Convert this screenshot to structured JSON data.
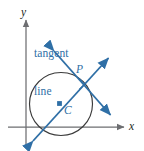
{
  "figure": {
    "kind": "geometry-diagram",
    "background_color": "#ffffff",
    "accent_color": "#2f6fa6",
    "axis_color": "#6d6e71",
    "circle_color": "#3b3b3b",
    "labels": {
      "tangent_line": "tangent\nline",
      "tangent_line_row1": "tangent",
      "tangent_line_row2": "line",
      "axis_x": "x",
      "axis_y": "y",
      "point_p": "P",
      "center_c": "C"
    },
    "geometry": {
      "axes": {
        "x_axis": {
          "x1": 8,
          "y1": 127,
          "x2": 127,
          "y2": 127,
          "arrow": "end"
        },
        "y_axis": {
          "x1": 26,
          "y1": 146,
          "x2": 26,
          "y2": 17,
          "arrow": "end"
        }
      },
      "circle": {
        "cx": 61,
        "cy": 104,
        "r": 31.5
      },
      "center_point": {
        "x": 59.5,
        "y": 103.5,
        "marker": "square"
      },
      "tangent_point": {
        "x": 79.5,
        "y": 80.5,
        "marker": "none"
      },
      "radius_line": {
        "x1": 31,
        "y1": 144,
        "x2": 111,
        "y2": 55,
        "arrows": "both",
        "description": "line through center C and point P extended both ways"
      },
      "tangent_line": {
        "x1": 52,
        "y1": 49,
        "x2": 113,
        "y2": 118,
        "arrows": "both",
        "description": "tangent line touching the circle at P"
      },
      "right_angle_marker": {
        "x": 82,
        "y": 84,
        "size": 7.5
      }
    }
  }
}
